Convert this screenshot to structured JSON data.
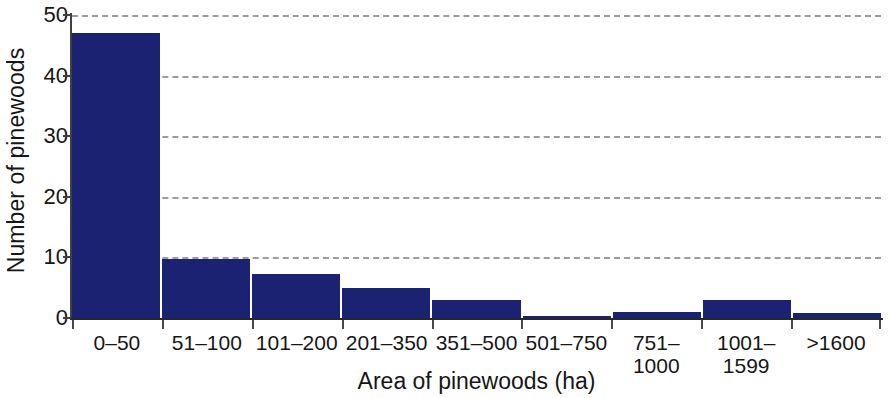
{
  "chart_data": {
    "type": "bar",
    "title": "",
    "subtitle": "",
    "xlabel": "Area of pinewoods (ha)",
    "ylabel": "Number of pinewoods",
    "categories": [
      "0–50",
      "51–100",
      "101–200",
      "201–350",
      "351–500",
      "501–750",
      "751–\n1000",
      "1001–\n1599",
      ">1600"
    ],
    "values": [
      47,
      9.7,
      7.3,
      5,
      3,
      0.3,
      1,
      3,
      0.8
    ],
    "ylim": [
      0,
      50
    ],
    "yticks": [
      0,
      10,
      20,
      30,
      40,
      50
    ],
    "ytick_labels": [
      "0",
      "10",
      "20",
      "30",
      "40",
      "50"
    ],
    "grid": "horizontal-dashed",
    "legend": "none",
    "bar_color": "#1b2272",
    "gridline_color": "#9c9c9c",
    "axis_color": "#23272e"
  }
}
